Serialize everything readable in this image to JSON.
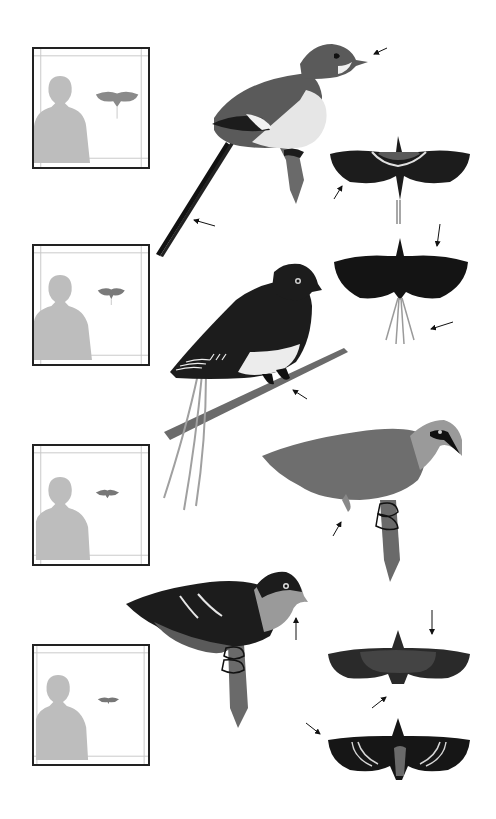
{
  "plate": {
    "kind": "field-guide illustration plate",
    "palette": {
      "background": "#ffffff",
      "ink": "#111111",
      "dark_plumage": "#1c1c1c",
      "mid_plumage": "#5a5a5a",
      "light_plumage": "#8a8a8a",
      "pale_plumage": "#d8d8d8",
      "silhouette": "#bdbdbd",
      "frame_line": "#c8c8c8"
    },
    "species": [
      {
        "id": "species-1",
        "figures": [
          "perched-side-view",
          "flight-dorsal-view"
        ],
        "features": [
          "long streamer tail",
          "pale underparts",
          "dark eye patch",
          "white wing bar"
        ]
      },
      {
        "id": "species-2",
        "figures": [
          "perched-side-view",
          "flight-dorsal-view"
        ],
        "features": [
          "long tail plumes",
          "dark upperparts",
          "pale belly",
          "spotted wing coverts"
        ]
      },
      {
        "id": "species-3",
        "figures": [
          "perched-side-view"
        ],
        "features": [
          "grey body",
          "dark mask",
          "short tail"
        ]
      },
      {
        "id": "species-4",
        "figures": [
          "perched-side-view",
          "flight-dorsal-view",
          "flight-ventral-view"
        ],
        "features": [
          "dark upperparts",
          "white wing streaks",
          "pale throat"
        ]
      }
    ],
    "scale_boxes": [
      {
        "id": "scale-box-1",
        "subject": "human silhouette with bird in flight"
      },
      {
        "id": "scale-box-2",
        "subject": "human silhouette with bird in flight"
      },
      {
        "id": "scale-box-3",
        "subject": "human silhouette with bird in flight"
      },
      {
        "id": "scale-box-4",
        "subject": "human silhouette with bird in flight"
      }
    ],
    "page_number": ""
  }
}
